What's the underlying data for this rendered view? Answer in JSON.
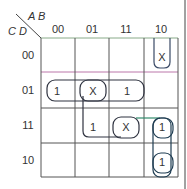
{
  "kmap": {
    "var_top": "A B",
    "var_left": "C D",
    "col_headers": [
      "00",
      "01",
      "11",
      "10"
    ],
    "row_headers": [
      "00",
      "01",
      "11",
      "10"
    ],
    "cells": [
      [
        "",
        "",
        "",
        "X"
      ],
      [
        "1",
        "X",
        "1",
        ""
      ],
      [
        "",
        "1",
        "X",
        "1"
      ],
      [
        "",
        "",
        "",
        "1"
      ]
    ],
    "groups": [
      {
        "name": "row01-group",
        "cells": [
          [
            1,
            0
          ],
          [
            1,
            1
          ],
          [
            1,
            2
          ]
        ],
        "color": "#2f3340"
      },
      {
        "name": "square-group",
        "cells": [
          [
            1,
            1
          ],
          [
            1,
            2
          ],
          [
            2,
            1
          ],
          [
            2,
            2
          ]
        ],
        "color": "#2f3340"
      },
      {
        "name": "col10-x-group",
        "cells": [
          [
            0,
            3
          ]
        ],
        "color": "#3a4a66"
      },
      {
        "name": "col10-vertical-group",
        "cells": [
          [
            2,
            3
          ],
          [
            3,
            3
          ]
        ],
        "color": "#1f3d52"
      },
      {
        "name": "row11-pair-group",
        "cells": [
          [
            2,
            2
          ],
          [
            2,
            3
          ]
        ],
        "color": "#1f3d52"
      }
    ]
  }
}
